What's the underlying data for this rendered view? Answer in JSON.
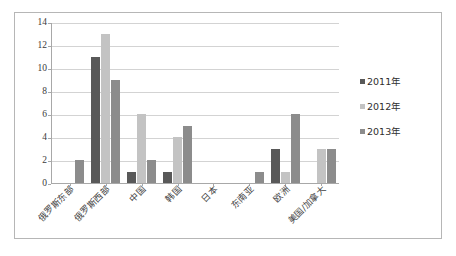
{
  "chart_data": {
    "type": "bar",
    "title": "",
    "subtitle": "",
    "xlabel": "",
    "ylabel": "",
    "ylim": [
      0,
      14
    ],
    "ytick_labels": [
      "0",
      "2",
      "4",
      "6",
      "8",
      "10",
      "12",
      "14"
    ],
    "ytick_values": [
      0,
      2,
      4,
      6,
      8,
      10,
      12,
      14
    ],
    "grid": true,
    "legend_position": "right",
    "categories": [
      "俄罗斯东部",
      "俄罗斯西部",
      "中国",
      "韩国",
      "日本",
      "东南亚",
      "欧洲",
      "美国/加拿大"
    ],
    "series": [
      {
        "name": "2011年",
        "color": "#595959",
        "values": [
          0,
          11,
          1,
          1,
          0,
          0,
          3,
          0
        ]
      },
      {
        "name": "2012年",
        "color": "#c3c3c3",
        "values": [
          0,
          13,
          6,
          4,
          0,
          0,
          1,
          3
        ]
      },
      {
        "name": "2013年",
        "color": "#8c8c8c",
        "values": [
          2,
          9,
          2,
          5,
          0,
          1,
          6,
          3
        ]
      }
    ]
  },
  "legend": {
    "items": [
      {
        "label": "2011年",
        "color": "#595959"
      },
      {
        "label": "2012年",
        "color": "#c3c3c3"
      },
      {
        "label": "2013年",
        "color": "#8c8c8c"
      }
    ]
  },
  "colors": {
    "frame_border": "#b6b6b6",
    "gridline": "#d3d3d3",
    "axis": "#a8a8a8",
    "background": "#ffffff",
    "text": "#3a3a3a"
  }
}
